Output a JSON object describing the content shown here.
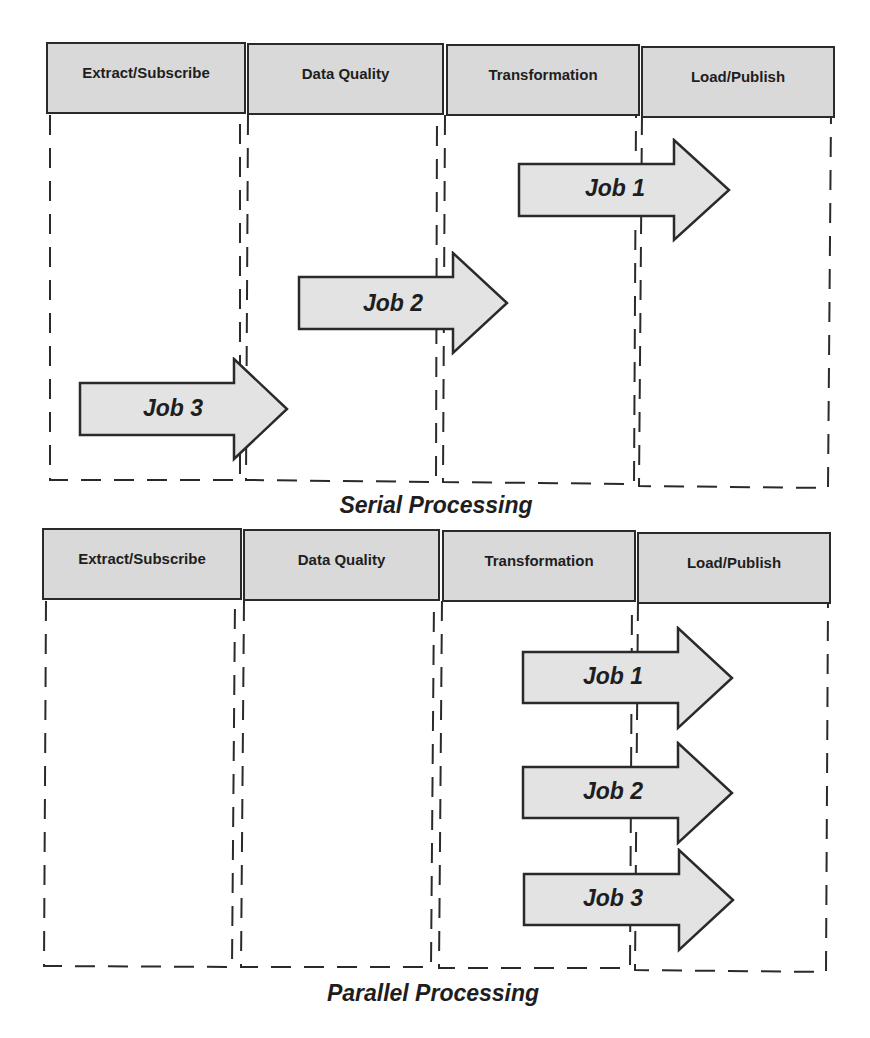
{
  "serial": {
    "caption": "Serial Processing",
    "stages": [
      {
        "label": "Extract/Subscribe"
      },
      {
        "label": "Data Quality"
      },
      {
        "label": "Transformation"
      },
      {
        "label": "Load/Publish"
      }
    ],
    "jobs": [
      {
        "label": "Job 1",
        "from_stage": "Transformation",
        "to_stage": "Load/Publish"
      },
      {
        "label": "Job 2",
        "from_stage": "Data Quality",
        "to_stage": "Transformation"
      },
      {
        "label": "Job 3",
        "from_stage": "Extract/Subscribe",
        "to_stage": "Data Quality"
      }
    ]
  },
  "parallel": {
    "caption": "Parallel Processing",
    "stages": [
      {
        "label": "Extract/Subscribe"
      },
      {
        "label": "Data Quality"
      },
      {
        "label": "Transformation"
      },
      {
        "label": "Load/Publish"
      }
    ],
    "jobs": [
      {
        "label": "Job 1",
        "from_stage": "Transformation",
        "to_stage": "Load/Publish"
      },
      {
        "label": "Job 2",
        "from_stage": "Transformation",
        "to_stage": "Load/Publish"
      },
      {
        "label": "Job 3",
        "from_stage": "Transformation",
        "to_stage": "Load/Publish"
      }
    ]
  },
  "colors": {
    "header_fill": "#d9d9d9",
    "arrow_fill": "#e3e3e3",
    "stroke": "#2a2a2a",
    "text": "#1e1e1e"
  }
}
